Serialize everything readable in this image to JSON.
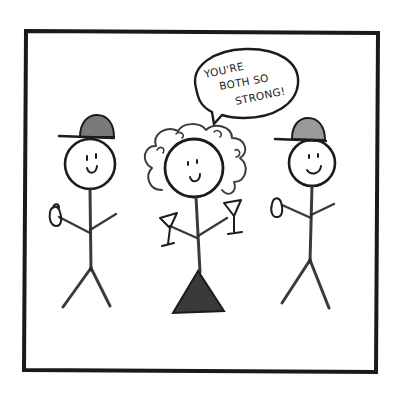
{
  "panel": {
    "type": "single-panel comic",
    "style": "pencil stick figures on white",
    "border_color": "#1a1a1a",
    "background": "#ffffff"
  },
  "speech_bubble": {
    "speaker": "woman-in-middle",
    "lines": [
      "YOU'RE",
      "BOTH SO",
      "STRONG!"
    ]
  },
  "characters": [
    {
      "id": "left-figure",
      "description": "stick figure wearing a baseball cap, holding a can"
    },
    {
      "id": "middle-figure",
      "description": "stick figure woman with curly hair and triangle dress holding two martini glasses"
    },
    {
      "id": "right-figure",
      "description": "stick figure wearing a baseball cap, holding a can"
    }
  ]
}
